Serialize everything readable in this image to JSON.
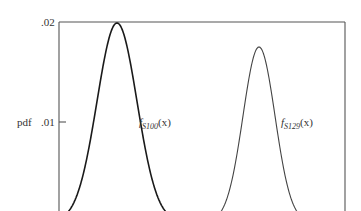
{
  "chart_data": {
    "type": "line",
    "title": "",
    "xlabel": "",
    "ylabel": "pdf",
    "ylim": [
      0,
      0.02
    ],
    "yticks": [
      {
        "value": 0.01,
        "label": ".01"
      },
      {
        "value": 0.02,
        "label": ".02"
      }
    ],
    "grid": false,
    "legend": "inline labels next to curves",
    "series": [
      {
        "name": "f_S100(x)",
        "label_main": "f",
        "label_sub": "S100",
        "label_arg": "(x)",
        "shape": "normal",
        "peak_pdf": 0.0199,
        "center_px": 117,
        "sigma_px": 20,
        "stroke": "#1a1a1a",
        "stroke_width": 1.6
      },
      {
        "name": "f_S129(x)",
        "label_main": "f",
        "label_sub": "S129",
        "label_arg": "(x)",
        "shape": "normal",
        "peak_pdf": 0.0175,
        "center_px": 259,
        "sigma_px": 16,
        "stroke": "#444444",
        "stroke_width": 1.1
      }
    ]
  },
  "axes": {
    "ylabel": "pdf",
    "tick_02": ".02",
    "tick_01": ".01"
  },
  "labels": {
    "s100": {
      "main": "f",
      "sub": "S100",
      "arg": "(x)"
    },
    "s129": {
      "main": "f",
      "sub": "S129",
      "arg": "(x)"
    }
  }
}
